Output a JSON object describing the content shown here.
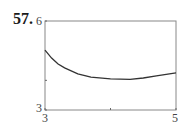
{
  "problem_number": "57.",
  "chart_data": {
    "type": "line",
    "title": "",
    "xlabel": "",
    "ylabel": "",
    "xlim": [
      3,
      5
    ],
    "ylim": [
      3,
      6
    ],
    "x_tick_labels": [
      "3",
      "5"
    ],
    "y_tick_labels": [
      "3",
      "6"
    ],
    "x_ticks": [
      3,
      4,
      5
    ],
    "y_ticks": [
      3,
      4,
      6
    ],
    "grid": false,
    "legend": null,
    "series": [
      {
        "name": "curve",
        "x": [
          3.0,
          3.1,
          3.2,
          3.3,
          3.5,
          3.7,
          4.0,
          4.3,
          4.5,
          4.7,
          5.0
        ],
        "y": [
          5.02,
          4.75,
          4.55,
          4.42,
          4.22,
          4.11,
          4.05,
          4.03,
          4.08,
          4.15,
          4.25
        ]
      }
    ]
  },
  "labels": {
    "y_top": "6",
    "y_bottom": "3",
    "x_left": "3",
    "x_right": "5"
  }
}
